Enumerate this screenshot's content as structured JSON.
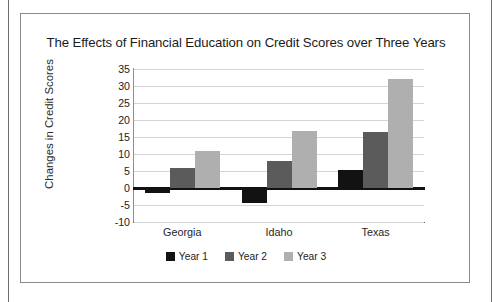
{
  "figure": {
    "title": "The Effects of Financial Education on Credit Scores over Three Years"
  },
  "chart_data": {
    "type": "bar",
    "title": "The Effects of Financial Education on Credit Scores over Three Years",
    "xlabel": "",
    "ylabel": "Changes in Credit Scores",
    "categories": [
      "Georgia",
      "Idaho",
      "Texas"
    ],
    "series": [
      {
        "name": "Year 1",
        "color": "#121212",
        "values": [
          -1.5,
          -4.5,
          5.3
        ]
      },
      {
        "name": "Year 2",
        "color": "#5b5b5b",
        "values": [
          6.0,
          8.0,
          16.5
        ]
      },
      {
        "name": "Year 3",
        "color": "#afafaf",
        "values": [
          11.0,
          16.7,
          32.0
        ]
      }
    ],
    "ylim": [
      -10,
      35
    ],
    "ytick_values": [
      35,
      30,
      25,
      20,
      15,
      10,
      5,
      0,
      -5,
      -10
    ],
    "ytick_labels": [
      "35",
      "30",
      "25",
      "20",
      "15",
      "10",
      "5",
      "0",
      "-5",
      "-10"
    ],
    "grid": true,
    "legend_position": "bottom",
    "zero_line": 0
  },
  "legend": {
    "items": [
      {
        "label": "Year 1",
        "color": "#121212"
      },
      {
        "label": "Year 2",
        "color": "#5b5b5b"
      },
      {
        "label": "Year 3",
        "color": "#afafaf"
      }
    ]
  }
}
